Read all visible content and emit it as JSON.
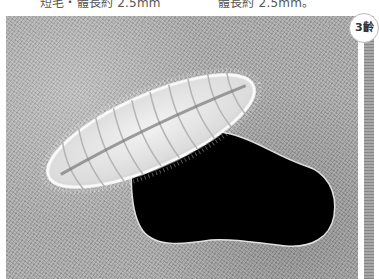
{
  "captions": {
    "left": "短毛・體長約 2.5mm",
    "right": "體長約 2.5mm。"
  },
  "badge": {
    "label": "3齡"
  },
  "photo": {
    "subject": "caterpillar-larva",
    "description": "Hairy pale segmented larva beside a feeding hole in a leaf"
  },
  "colors": {
    "background": "#ffffff",
    "leaf_texture": "#a9a9a9",
    "larva": "#e8e8e8",
    "hole": "#000000",
    "caption_text": "#555555"
  }
}
